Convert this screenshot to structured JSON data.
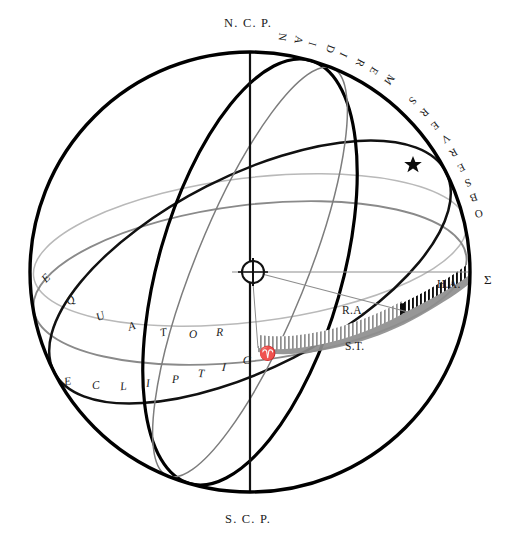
{
  "figure": {
    "width": 520,
    "height": 547,
    "background_color": "#ffffff"
  },
  "colors": {
    "outline": "#000000",
    "ecliptic": "#111111",
    "equator": "#8a8a8a",
    "horizon": "#9a9a9a",
    "hour_circle": "#7d7d7d",
    "ra_band": "#8e8e8e",
    "ha_band": "#0d0d0d",
    "text": "#1a1a1a"
  },
  "labels": {
    "north_pole": "N. C. P.",
    "south_pole": "S. C. P.",
    "meridian": "OBSERVERS MERIDIAN",
    "equator": "EQUATOR",
    "ecliptic": "ECLIPTIC",
    "right_ascension": "R.A.",
    "hour_angle": "H.A.",
    "sidereal_time": "S.T.",
    "sigma": "Σ",
    "aries": "♈"
  },
  "icons": {
    "star": "star-icon",
    "earth": "earth-symbol-icon",
    "aries": "aries-symbol-icon"
  },
  "chart_data": {
    "type": "diagram",
    "sphere": {
      "center_x": 250,
      "center_y": 272,
      "radius": 220
    },
    "points": [
      {
        "name": "N. C. P.",
        "label": "N. C. P.",
        "x": 250,
        "y": 52,
        "role": "north-celestial-pole"
      },
      {
        "name": "S. C. P.",
        "label": "S. C. P.",
        "x": 250,
        "y": 492,
        "role": "south-celestial-pole"
      },
      {
        "name": "Earth",
        "label": "⊕",
        "x": 253,
        "y": 272,
        "role": "observer-center"
      },
      {
        "name": "Star",
        "label": "★",
        "x": 413,
        "y": 165,
        "role": "star"
      },
      {
        "name": "Vernal equinox",
        "label": "♈",
        "x": 266,
        "y": 355,
        "role": "first-point-of-aries"
      },
      {
        "name": "Sigma",
        "label": "Σ",
        "x": 489,
        "y": 282,
        "role": "meridian-equator-intersection"
      }
    ],
    "great_circles": [
      {
        "name": "limb",
        "label": "sphere outline",
        "color": "#000000",
        "width": 3.4
      },
      {
        "name": "observers-meridian",
        "label": "OBSERVERS MERIDIAN",
        "color": "#000000",
        "width": 3.4
      },
      {
        "name": "equator",
        "label": "EQUATOR",
        "color": "#8a8a8a",
        "width": 1.8
      },
      {
        "name": "ecliptic",
        "label": "ECLIPTIC",
        "color": "#111111",
        "width": 2.6
      },
      {
        "name": "horizon",
        "label": "horizon",
        "color": "#9a9a9a",
        "width": 1.6
      },
      {
        "name": "hour-circle-of-star",
        "label": "hour circle",
        "color": "#7d7d7d",
        "width": 1.6
      },
      {
        "name": "polar-axis",
        "label": "polar axis",
        "color": "#111111",
        "width": 2.2
      }
    ],
    "arcs": [
      {
        "name": "R.A.",
        "label": "R.A.",
        "from": "♈",
        "to": "hour circle of star",
        "shading": "gray-hatched",
        "color": "#8e8e8e"
      },
      {
        "name": "H.A.",
        "label": "H.A.",
        "from": "hour circle of star",
        "to": "Σ",
        "shading": "black-hatched",
        "color": "#0d0d0d"
      },
      {
        "name": "S.T.",
        "label": "S.T.",
        "from": "♈",
        "to": "Σ",
        "shading": "solid-gray-band",
        "color": "#8e8e8e"
      }
    ],
    "annotations": [
      {
        "text": "R.A.",
        "x": 359,
        "y": 314,
        "placement": "above-band"
      },
      {
        "text": "H.A.",
        "x": 452,
        "y": 289,
        "placement": "above-band"
      },
      {
        "text": "S.T.",
        "x": 362,
        "y": 348,
        "placement": "below-band"
      }
    ]
  },
  "equator_letters": [
    "E",
    "Q",
    "U",
    "A",
    "T",
    "O",
    "R"
  ],
  "ecliptic_letters": [
    "E",
    "C",
    "L",
    "I",
    "P",
    "T",
    "I",
    "C"
  ],
  "meridian_letters": [
    "O",
    "B",
    "S",
    "E",
    "R",
    "V",
    "E",
    "R",
    "S",
    " ",
    "M",
    "E",
    "R",
    "I",
    "D",
    "I",
    "A",
    "N"
  ]
}
